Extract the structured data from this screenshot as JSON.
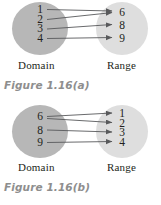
{
  "page": {
    "background": "#ffffff",
    "width": 161,
    "height": 205
  },
  "style": {
    "domain_circle_color": "#b7b7b7",
    "range_circle_color": "#dedede",
    "arrow_color": "#58595b",
    "text_color": "#231f20",
    "caption_color": "#8e8e8e"
  },
  "figures": [
    {
      "id": "figure-a",
      "caption": "Figure 1.16(a)",
      "domain": {
        "label": "Domain",
        "elements": [
          "1",
          "2",
          "3",
          "4"
        ]
      },
      "range": {
        "label": "Range",
        "elements": [
          "6",
          "8",
          "9"
        ]
      },
      "mappings": [
        {
          "from": "1",
          "to": "6"
        },
        {
          "from": "2",
          "to": "6"
        },
        {
          "from": "3",
          "to": "8"
        },
        {
          "from": "4",
          "to": "9"
        }
      ]
    },
    {
      "id": "figure-b",
      "caption": "Figure 1.16(b)",
      "domain": {
        "label": "Domain",
        "elements": [
          "6",
          "8",
          "9"
        ]
      },
      "range": {
        "label": "Range",
        "elements": [
          "1",
          "2",
          "3",
          "4"
        ]
      },
      "mappings": [
        {
          "from": "6",
          "to": "1"
        },
        {
          "from": "6",
          "to": "2"
        },
        {
          "from": "8",
          "to": "3"
        },
        {
          "from": "9",
          "to": "4"
        }
      ]
    }
  ]
}
